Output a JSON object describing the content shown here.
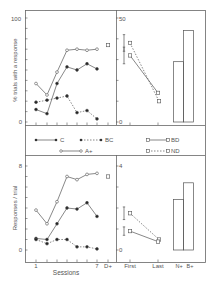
{
  "figure": {
    "colors": {
      "ink": "#555555",
      "background": "#ffffff"
    }
  },
  "legend": {
    "entries": [
      {
        "key": "C",
        "label": "C",
        "marker": "filled-circle",
        "line": "solid"
      },
      {
        "key": "BC",
        "label": "BC",
        "marker": "filled-circle",
        "line": "dotted"
      },
      {
        "key": "A",
        "label": "A+",
        "marker": "open-circle",
        "line": "solid"
      },
      {
        "key": "BD",
        "label": "BD",
        "marker": "open-square",
        "line": "solid"
      },
      {
        "key": "ND",
        "label": "ND",
        "marker": "open-square",
        "line": "dotted"
      }
    ]
  },
  "axes": {
    "top_left_ylabel": "% trials with a response",
    "bottom_left_ylabel": "Responses / trial",
    "bottom_left_xlabel": "Sessions",
    "x_ticks_left": [
      "1",
      "7",
      "D+"
    ],
    "x_ticks_right": [
      "First",
      "Last"
    ],
    "bar_labels": [
      "N+",
      "B+"
    ],
    "top_left_yticks": [
      "100",
      "0"
    ],
    "top_right_yticks": [
      "50",
      "0"
    ],
    "bottom_left_yticks": [
      "8",
      "0"
    ],
    "bottom_right_yticks": [
      "4",
      "0"
    ]
  },
  "chart_data": [
    {
      "type": "line",
      "title": "",
      "panel": "top-left",
      "xlabel": "Sessions",
      "ylabel": "% trials with a response",
      "ylim": [
        0,
        100
      ],
      "x": [
        1,
        2,
        3,
        4,
        5,
        6,
        7
      ],
      "series": [
        {
          "name": "A+",
          "values": [
            37,
            26,
            48,
            69,
            70,
            69,
            70
          ]
        },
        {
          "name": "C",
          "values": [
            12,
            8,
            37,
            53,
            50,
            56,
            51
          ]
        },
        {
          "name": "BC",
          "values": [
            19,
            21,
            23,
            25,
            9,
            11,
            3
          ]
        }
      ],
      "extra_points": [
        {
          "x": "D+",
          "value": 74,
          "marker": "open-square"
        }
      ]
    },
    {
      "type": "line",
      "panel": "top-right",
      "xlabel": "",
      "ylabel": "% trials with a response",
      "ylim": [
        0,
        50
      ],
      "categories": [
        "First",
        "Last"
      ],
      "series": [
        {
          "name": "ND",
          "values": [
            38,
            10
          ],
          "error_first": 4
        },
        {
          "name": "BD",
          "values": [
            32,
            14
          ],
          "error_first": 4
        }
      ]
    },
    {
      "type": "bar",
      "panel": "top-right-bars",
      "ylim": [
        0,
        50
      ],
      "categories": [
        "N+",
        "B+"
      ],
      "values": [
        29,
        44
      ]
    },
    {
      "type": "line",
      "panel": "bottom-left",
      "xlabel": "Sessions",
      "ylabel": "Responses / trial",
      "ylim": [
        0,
        8
      ],
      "x": [
        1,
        2,
        3,
        4,
        5,
        6,
        7
      ],
      "series": [
        {
          "name": "A+",
          "values": [
            3.8,
            2.5,
            4.6,
            7.0,
            6.7,
            7.2,
            7.3
          ]
        },
        {
          "name": "C",
          "values": [
            1.1,
            1.0,
            2.5,
            4.0,
            3.9,
            4.5,
            3.2
          ]
        },
        {
          "name": "BC",
          "values": [
            1.0,
            0.6,
            1.0,
            1.0,
            0.3,
            0.3,
            0.1
          ]
        }
      ],
      "extra_points": [
        {
          "x": "D+",
          "value": 7.0,
          "marker": "open-square"
        }
      ]
    },
    {
      "type": "line",
      "panel": "bottom-right",
      "ylabel": "Responses / trial",
      "ylim": [
        0,
        4
      ],
      "categories": [
        "First",
        "Last"
      ],
      "series": [
        {
          "name": "ND",
          "values": [
            1.75,
            0.5
          ],
          "error_first": 0.3
        },
        {
          "name": "BD",
          "values": [
            0.9,
            0.4
          ],
          "error_first": 0.2
        }
      ]
    },
    {
      "type": "bar",
      "panel": "bottom-right-bars",
      "ylim": [
        0,
        4
      ],
      "categories": [
        "N+",
        "B+"
      ],
      "values": [
        2.4,
        3.2
      ]
    }
  ]
}
